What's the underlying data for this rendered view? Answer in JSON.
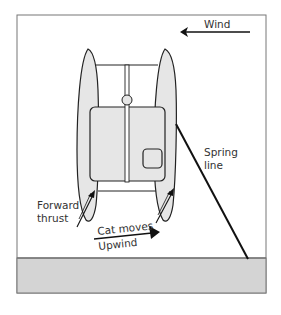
{
  "diagram": {
    "type": "catamaran-docking-spring-line",
    "labels": {
      "wind": "Wind",
      "spring_line_1": "Spring",
      "spring_line_2": "line",
      "forward_thrust_1": "Forward",
      "forward_thrust_2": "thrust",
      "cat_moves_1": "Cat moves",
      "cat_moves_2": "Upwind"
    },
    "colors": {
      "frame": "#777777",
      "hull_fill": "#e6e6e6",
      "dock_fill": "#d4d4d4",
      "line": "#111111",
      "text": "#333333"
    }
  }
}
